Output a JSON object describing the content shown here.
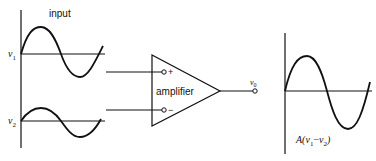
{
  "diagram": {
    "input_label": "input",
    "inputs": [
      {
        "symbol": "v",
        "subscript": "1",
        "terminal": "+"
      },
      {
        "symbol": "v",
        "subscript": "2",
        "terminal": "−"
      }
    ],
    "amplifier_label": "amplifier",
    "output": {
      "symbol": "v",
      "subscript": "0"
    },
    "output_waveform_label_prefix": "A(",
    "output_waveform_label_v1": "v",
    "output_waveform_label_v1_sub": "1",
    "output_waveform_label_minus": "−",
    "output_waveform_label_v2": "v",
    "output_waveform_label_v2_sub": "2",
    "output_waveform_label_suffix": ")",
    "colors": {
      "ink": "#111111",
      "background": "#ffffff"
    }
  }
}
